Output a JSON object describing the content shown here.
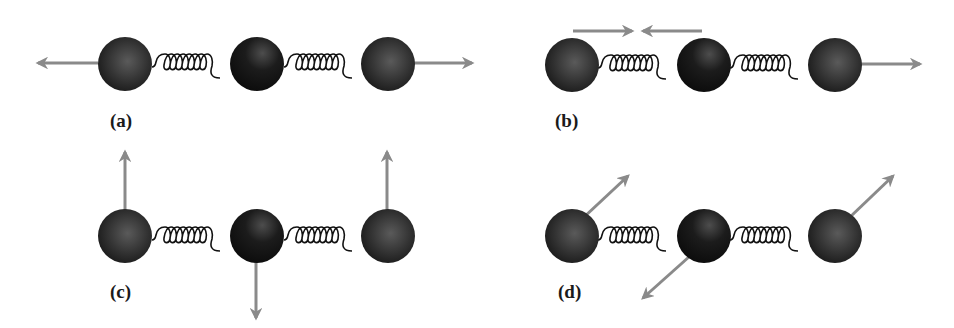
{
  "figure": {
    "colors": {
      "arrow": "#8a8a8a",
      "atom_outer": "#1e1e1e",
      "atom_inner": "#4a4a4a",
      "center_atom_inner": "#2e2e2e",
      "spring": "#111111",
      "background": "#ffffff"
    },
    "panels": [
      {
        "id": "a",
        "label": "(a)",
        "mode": "symmetric stretch",
        "arrows": [
          "left atom: left",
          "right atom: right"
        ]
      },
      {
        "id": "b",
        "label": "(b)",
        "mode": "asymmetric stretch",
        "arrows": [
          "left spring: inward pair",
          "right atom: right"
        ]
      },
      {
        "id": "c",
        "label": "(c)",
        "mode": "bending (perpendicular)",
        "arrows": [
          "left atom: up",
          "center atom: down",
          "right atom: up"
        ]
      },
      {
        "id": "d",
        "label": "(d)",
        "mode": "bending (oblique)",
        "arrows": [
          "left atom: up-right",
          "center atom: down-left",
          "right atom: up-right"
        ]
      }
    ]
  }
}
